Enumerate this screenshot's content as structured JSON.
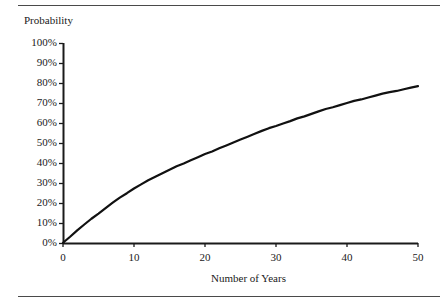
{
  "figure": {
    "background_color": "#ffffff",
    "rules": {
      "top_label": "top-horizontal-rule",
      "bottom_label": "bottom-horizontal-rule",
      "color": "#4a4a4a"
    }
  },
  "chart_data": {
    "type": "line",
    "title": "",
    "ylabel": "Probability",
    "xlabel": "Number of Years",
    "xlim": [
      0,
      50
    ],
    "ylim": [
      0,
      100
    ],
    "grid": false,
    "legend": false,
    "legend_position": "none",
    "line_color": "#111111",
    "line_width": 2.2,
    "xticks": [
      0,
      10,
      20,
      30,
      40,
      50
    ],
    "xtick_labels": [
      "0",
      "10",
      "20",
      "30",
      "40",
      "50"
    ],
    "yticks": [
      0,
      10,
      20,
      30,
      40,
      50,
      60,
      70,
      80,
      90,
      100
    ],
    "ytick_labels": [
      "0%",
      "10%",
      "20%",
      "30%",
      "40%",
      "50%",
      "60%",
      "70%",
      "80%",
      "90%",
      "100%"
    ],
    "x": [
      0,
      1,
      2,
      3,
      4,
      5,
      6,
      7,
      8,
      9,
      10,
      11,
      12,
      13,
      14,
      15,
      16,
      17,
      18,
      19,
      20,
      21,
      22,
      23,
      24,
      25,
      26,
      27,
      28,
      29,
      30,
      31,
      32,
      33,
      34,
      35,
      36,
      37,
      38,
      39,
      40,
      41,
      42,
      43,
      44,
      45,
      46,
      47,
      48,
      49,
      50
    ],
    "values": [
      0.0,
      3.2,
      6.3,
      9.2,
      12.0,
      14.8,
      17.5,
      20.1,
      22.6,
      25.0,
      27.3,
      29.3,
      31.3,
      33.2,
      34.9,
      36.6,
      38.3,
      39.9,
      41.4,
      42.9,
      44.4,
      45.9,
      47.4,
      48.8,
      50.2,
      51.6,
      53.2,
      54.6,
      56.0,
      57.3,
      58.6,
      59.8,
      60.9,
      62.2,
      63.4,
      64.6,
      65.8,
      66.9,
      68.0,
      69.0,
      70.0,
      71.0,
      71.9,
      72.8,
      73.7,
      74.6,
      75.3,
      76.1,
      76.9,
      77.6,
      78.3
    ]
  },
  "axis_title": {
    "y": "Probability",
    "x": "Number of Years"
  }
}
